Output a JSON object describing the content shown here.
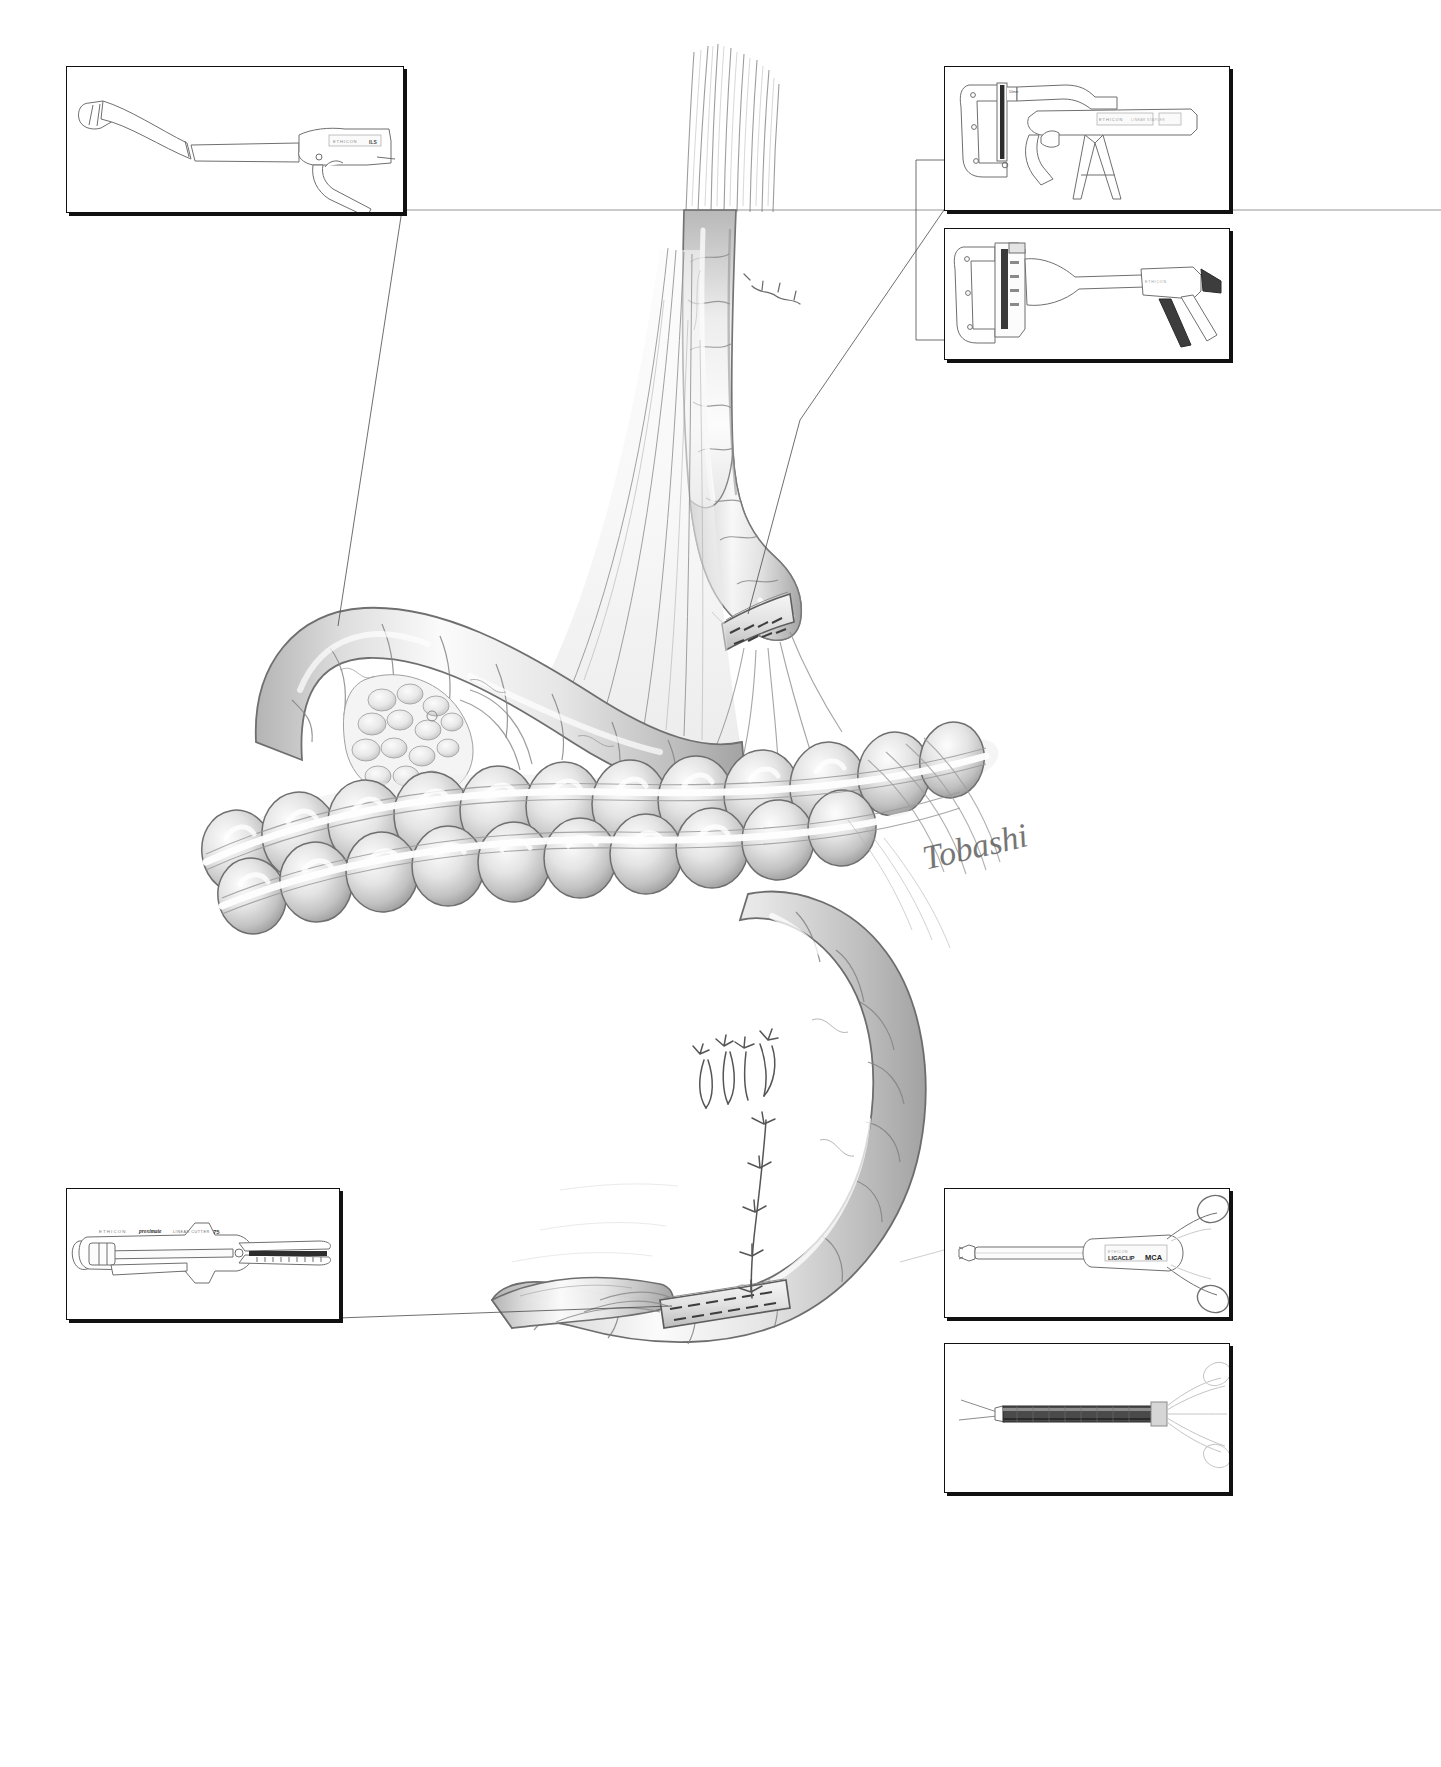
{
  "figure": {
    "medium": "graphite pencil rendering on white ground",
    "signature": "Tobashi",
    "background_color": "#ffffff",
    "ink_color": "#3c3c3c",
    "shade_color": "#9a9a9a"
  },
  "insets": [
    {
      "id": "inset-top-left",
      "position": "top-left",
      "x": 66,
      "y": 66,
      "w": 336,
      "h": 145,
      "instrument": "curved intraluminal circular stapler with long shaft and pistol grip",
      "brand": "ETHICON",
      "label_primary": "ETHICON",
      "label_secondary": "ILS",
      "leader_to": "proximal-bowel-limb"
    },
    {
      "id": "inset-top-right",
      "position": "top-right",
      "x": 944,
      "y": 66,
      "w": 284,
      "h": 143,
      "instrument": "linear stapler TA-type with anvil jaw and pistol handle",
      "brand": "ETHICON",
      "label_primary": "ETHICON",
      "label_secondary": "LINEAR STAPLER",
      "leader_to": "proximal-staple-line"
    },
    {
      "id": "inset-mid-right",
      "position": "mid-right",
      "x": 944,
      "y": 228,
      "w": 284,
      "h": 130,
      "instrument": "open linear stapler, jaws separated, angled handle",
      "brand": "ETHICON",
      "label_primary": "ETHICON",
      "label_secondary": "",
      "leader_to": "proximal-staple-line"
    },
    {
      "id": "inset-bottom-left",
      "position": "bottom-left",
      "x": 66,
      "y": 1188,
      "w": 272,
      "h": 130,
      "instrument": "linear cutter with scored cartridge scale",
      "brand": "ETHICON",
      "label_primary": "ETHICON",
      "label_secondary": "proximate",
      "label_tertiary": "LINEAR CUTTER",
      "label_size": "75",
      "leader_to": "distal-staple-line"
    },
    {
      "id": "inset-lower-right",
      "position": "lower-right",
      "x": 944,
      "y": 1188,
      "w": 284,
      "h": 128,
      "instrument": "ligating clip applier with ring-handle scissors grip",
      "brand": "ETHICON",
      "label_primary": "ETHICON",
      "label_secondary": "LIGACLIP",
      "label_tertiary": "MCA",
      "leader_to": "mesenteric-vessels"
    },
    {
      "id": "inset-bottom-right",
      "position": "bottom-right",
      "x": 944,
      "y": 1343,
      "w": 284,
      "h": 148,
      "instrument": "dissecting forceps / needle holder with dark shaft, ghosted ring handles",
      "brand": "",
      "label_primary": "",
      "label_secondary": "",
      "leader_to": ""
    }
  ],
  "anatomy": [
    {
      "id": "proximal-bowel-limb",
      "label": "proximal small-bowel limb descending from upper field"
    },
    {
      "id": "mesentery-fan",
      "label": "mesenteric fan with vessel arcades"
    },
    {
      "id": "proximal-staple-line",
      "label": "transverse stapled closure on proximal limb"
    },
    {
      "id": "transverse-colon",
      "label": "haustrated large bowel crossing the midfield"
    },
    {
      "id": "epiploic-appendages",
      "label": "fatty appendages along the taenia"
    },
    {
      "id": "distal-bowel-loop",
      "label": "distal bowel loop curving to lower right"
    },
    {
      "id": "interrupted-sutures",
      "label": "interrupted seromuscular sutures with tied knots"
    },
    {
      "id": "distal-staple-line",
      "label": "linear stapled closure at distal enterotomy"
    },
    {
      "id": "mesenteric-vessels",
      "label": "mesenteric vessels entering the bowel wall"
    }
  ],
  "annotations": {
    "signature_text": "Tobashi",
    "leader_style": "thin hairline leaders from inset corners to anatomic targets"
  }
}
